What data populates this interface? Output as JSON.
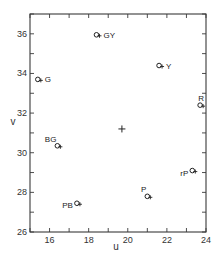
{
  "chart_data": {
    "type": "scatter",
    "title": "",
    "xlabel": "u",
    "ylabel": "v",
    "xlim": [
      15,
      24
    ],
    "ylim": [
      26,
      37
    ],
    "x_ticks": [
      16,
      18,
      20,
      22,
      24
    ],
    "y_ticks": [
      26,
      28,
      30,
      32,
      34,
      36
    ],
    "x_tick_labels": [
      "16",
      "18",
      "20",
      "22",
      "24"
    ],
    "y_tick_labels": [
      "26",
      "28",
      "30",
      "32",
      "34",
      "36"
    ],
    "grid": false,
    "legend": null,
    "center_point": {
      "u": 19.7,
      "v": 31.2,
      "marker": "plus"
    },
    "points": [
      {
        "label": "GY",
        "u": 18.4,
        "v": 35.95,
        "label_pos": "right"
      },
      {
        "label": "G",
        "u": 15.4,
        "v": 33.7,
        "label_pos": "right"
      },
      {
        "label": "Y",
        "u": 21.6,
        "v": 34.4,
        "label_pos": "right"
      },
      {
        "label": "R",
        "u": 23.7,
        "v": 32.4,
        "label_pos": "above"
      },
      {
        "label": "BG",
        "u": 16.4,
        "v": 30.35,
        "label_pos": "above-left"
      },
      {
        "label": "PB",
        "u": 17.4,
        "v": 27.45,
        "label_pos": "left"
      },
      {
        "label": "P",
        "u": 21.0,
        "v": 27.8,
        "label_pos": "above-left"
      },
      {
        "label": "rP",
        "u": 23.3,
        "v": 29.1,
        "label_pos": "left"
      }
    ]
  }
}
